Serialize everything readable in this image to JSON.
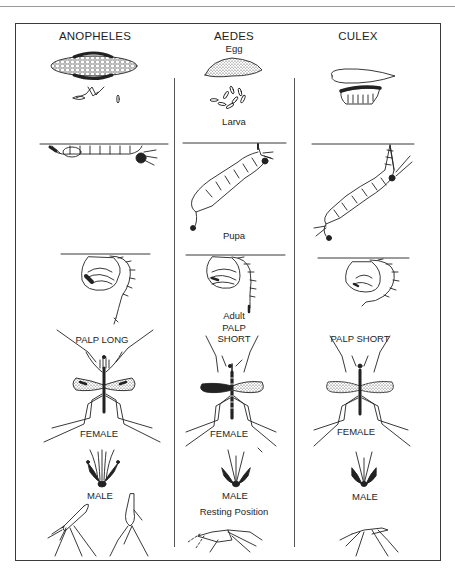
{
  "figure": {
    "columns": [
      {
        "genus": "ANOPHELES",
        "palp_label": "PALP LONG",
        "female_label": "FEMALE",
        "male_label": "MALE"
      },
      {
        "genus": "AEDES",
        "palp_label_line1": "PALP",
        "palp_label_line2": "SHORT",
        "female_label": "FEMALE",
        "male_label": "MALE"
      },
      {
        "genus": "CULEX",
        "palp_label": "PALP SHORT",
        "female_label": "FEMALE",
        "male_label": "MALE"
      }
    ],
    "stages": {
      "egg": "Egg",
      "larva": "Larva",
      "pupa": "Pupa",
      "adult": "Adult",
      "resting": "Resting Position"
    }
  }
}
